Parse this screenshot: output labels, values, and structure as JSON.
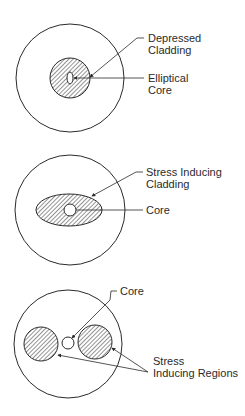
{
  "diagrams": [
    {
      "name": "elliptical-core-fiber",
      "labels": {
        "cladding_line1": "Depressed",
        "cladding_line2": "Cladding",
        "core_line1": "Elliptical",
        "core_line2": "Core"
      }
    },
    {
      "name": "elliptical-stress-cladding-fiber",
      "labels": {
        "cladding_line1": "Stress Inducing",
        "cladding_line2": "Cladding",
        "core": "Core"
      }
    },
    {
      "name": "stress-regions-fiber",
      "labels": {
        "core": "Core",
        "regions_line1": "Stress",
        "regions_line2": "Inducing Regions"
      }
    }
  ],
  "colors": {
    "stroke": "#2a2a2a",
    "background": "#ffffff"
  }
}
